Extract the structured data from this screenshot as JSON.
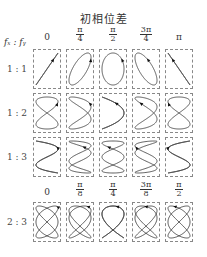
{
  "title": "初相位差",
  "axis_label": "fₓ : fᵧ",
  "top_headers": [
    {
      "type": "single",
      "text": "0"
    },
    {
      "type": "frac",
      "num": "π",
      "den": "4"
    },
    {
      "type": "frac",
      "num": "π",
      "den": "2"
    },
    {
      "type": "frac",
      "num": "3π",
      "den": "4"
    },
    {
      "type": "single",
      "text": "π"
    }
  ],
  "bottom_headers": [
    {
      "type": "single",
      "text": "0"
    },
    {
      "type": "frac",
      "num": "π",
      "den": "8"
    },
    {
      "type": "frac",
      "num": "π",
      "den": "4"
    },
    {
      "type": "frac",
      "num": "3π",
      "den": "8"
    },
    {
      "type": "frac",
      "num": "π",
      "den": "2"
    }
  ],
  "rows": [
    {
      "label": "1 : 1",
      "fx": 1,
      "fy": 1,
      "phases": [
        0,
        0.7854,
        1.5708,
        2.3562,
        3.1416
      ],
      "top": 49
    },
    {
      "label": "1 : 2",
      "fx": 1,
      "fy": 2,
      "phases": [
        0,
        0.7854,
        1.5708,
        2.3562,
        3.1416
      ],
      "top": 93
    },
    {
      "label": "1 : 3",
      "fx": 1,
      "fy": 3,
      "phases": [
        0,
        0.7854,
        1.5708,
        2.3562,
        3.1416
      ],
      "top": 137
    },
    {
      "label": "2 : 3",
      "fx": 2,
      "fy": 3,
      "phases": [
        0,
        0.3927,
        0.7854,
        1.1781,
        1.5708
      ],
      "top": 202
    }
  ],
  "column_x": [
    33,
    66,
    99,
    132,
    165
  ],
  "colors": {
    "curve": "#444444",
    "border": "#888888",
    "text": "#333333"
  }
}
